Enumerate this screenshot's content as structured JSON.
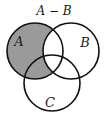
{
  "title": "A − B",
  "sets": [
    {
      "name": "A",
      "label": "A",
      "cx": 35,
      "cy": 51,
      "r": 28
    },
    {
      "name": "B",
      "label": "B",
      "cx": 71,
      "cy": 51,
      "r": 28
    },
    {
      "name": "C",
      "label": "C",
      "cx": 52,
      "cy": 83,
      "r": 28
    }
  ],
  "shaded_region": "A minus B",
  "colors": {
    "shade": "#9a9a9a",
    "stroke": "#111111",
    "background": "#ffffff"
  }
}
